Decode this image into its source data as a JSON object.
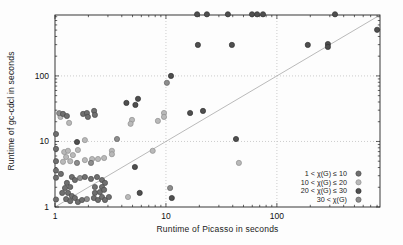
{
  "figure": {
    "xlabel": "Runtime of Picasso in seconds",
    "ylabel": "Runtime of gc-cdcl in seconds"
  },
  "chart_data": {
    "type": "scatter",
    "title": "",
    "xlabel": "Runtime of Picasso in seconds",
    "ylabel": "Runtime of gc-cdcl in seconds",
    "x_scale": "log",
    "y_scale": "log",
    "xlim": [
      1,
      850
    ],
    "ylim": [
      1,
      850
    ],
    "x_ticks": [
      1,
      10,
      100
    ],
    "y_ticks": [
      1,
      10,
      100
    ],
    "grid": "dotted lines at decades 10 and 100 on both axes",
    "diagonal_reference_line": "y = x",
    "legend_position": "inside bottom-right",
    "colors": {
      "axis": "#222222",
      "grid": "#c0c0c0",
      "diagonal": "#a8a8a8"
    },
    "series": [
      {
        "name": "1 < χ(G) ≤ 10",
        "color": "#6f6f6f",
        "edge": "#4b4b4b",
        "points": [
          [
            1.02,
            13.0
          ],
          [
            1.02,
            7.7
          ],
          [
            1.02,
            5.0
          ],
          [
            1.02,
            3.6
          ],
          [
            1.02,
            2.8
          ],
          [
            1.02,
            1.3
          ],
          [
            1.18,
            26.3
          ],
          [
            1.28,
            24.5
          ],
          [
            1.79,
            26.3
          ],
          [
            1.94,
            27.2
          ],
          [
            1.98,
            23.7
          ],
          [
            2.25,
            29.3
          ],
          [
            2.29,
            25.4
          ],
          [
            1.13,
            3.2
          ],
          [
            1.28,
            2.33
          ],
          [
            1.42,
            2.87
          ],
          [
            1.51,
            2.58
          ],
          [
            1.86,
            2.87
          ],
          [
            2.11,
            2.68
          ],
          [
            2.39,
            2.87
          ],
          [
            2.65,
            2.58
          ],
          [
            2.82,
            2.33
          ],
          [
            1.37,
            2.02
          ],
          [
            1.23,
            1.95
          ],
          [
            1.16,
            1.64
          ],
          [
            1.31,
            1.64
          ],
          [
            1.42,
            1.47
          ],
          [
            1.26,
            1.32
          ],
          [
            1.37,
            1.23
          ],
          [
            1.51,
            1.37
          ],
          [
            1.61,
            1.19
          ],
          [
            1.75,
            1.28
          ],
          [
            2.24,
            1.37
          ],
          [
            2.44,
            1.28
          ],
          [
            2.65,
            1.42
          ],
          [
            2.82,
            1.28
          ],
          [
            3.06,
            1.42
          ],
          [
            2.29,
            1.64
          ],
          [
            2.54,
            1.69
          ],
          [
            2.29,
            2.02
          ],
          [
            2.65,
            2.02
          ],
          [
            2.77,
            1.83
          ]
        ]
      },
      {
        "name": "10 < χ(G) ≤ 20",
        "color": "#b9b9b9",
        "edge": "#8f8f8f",
        "points": [
          [
            1.21,
            6.9
          ],
          [
            1.31,
            7.2
          ],
          [
            1.26,
            5.8
          ],
          [
            1.45,
            6.2
          ],
          [
            1.61,
            7.4
          ],
          [
            1.86,
            5.2
          ],
          [
            2.16,
            5.4
          ],
          [
            2.44,
            5.4
          ],
          [
            2.77,
            5.6
          ],
          [
            3.26,
            7.2
          ],
          [
            3.26,
            6.4
          ],
          [
            1.86,
            10.5
          ],
          [
            1.34,
            19.2
          ],
          [
            1.12,
            23.7
          ],
          [
            1.18,
            4.9
          ],
          [
            1.37,
            5.0
          ],
          [
            4.94,
            21.3
          ],
          [
            4.8,
            18.6
          ],
          [
            8.47,
            20.6
          ],
          [
            9.6,
            27.2
          ],
          [
            9.6,
            23.7
          ],
          [
            7.6,
            7.2
          ],
          [
            45.5,
            4.7
          ],
          [
            4.55,
            1.42
          ]
        ]
      },
      {
        "name": "20 < χ(G) ≤ 30",
        "color": "#4f4f4f",
        "edge": "#303030",
        "points": [
          [
            19.1,
            870
          ],
          [
            23.4,
            870
          ],
          [
            36.2,
            870
          ],
          [
            59.7,
            870
          ],
          [
            66.3,
            870
          ],
          [
            74.9,
            870
          ],
          [
            334,
            870
          ],
          [
            19.4,
            297
          ],
          [
            39.3,
            297
          ],
          [
            190,
            297
          ],
          [
            288,
            307
          ],
          [
            288,
            277
          ],
          [
            800,
            506
          ],
          [
            11.1,
            100
          ],
          [
            42.8,
            10.9
          ],
          [
            5.6,
            44.8
          ],
          [
            4.4,
            38.8
          ],
          [
            5.3,
            36.1
          ],
          [
            21.6,
            29.3
          ],
          [
            16.5,
            27.2
          ],
          [
            11.3,
            1.37
          ],
          [
            5.8,
            1.64
          ],
          [
            5.25,
            4.08
          ],
          [
            1.58,
            9.8
          ]
        ]
      },
      {
        "name": "30 < χ(G)",
        "color": "#8d8d8d",
        "edge": "#636363",
        "points": [
          [
            10.2,
            78.5
          ],
          [
            3.62,
            10.9
          ],
          [
            1.58,
            4.7
          ],
          [
            2.11,
            4.7
          ],
          [
            1.94,
            1.32
          ],
          [
            1.68,
            2.77
          ],
          [
            1.09,
            27.0
          ],
          [
            10.9,
            1.95
          ]
        ]
      }
    ]
  }
}
